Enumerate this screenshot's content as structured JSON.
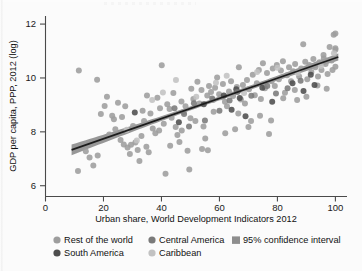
{
  "chart_data": {
    "type": "scatter",
    "title": "",
    "xlabel": "Urban share, World Development Indicators 2012",
    "ylabel": "GDP per capita, PPP, 2012 (log)",
    "xlim": [
      0,
      104
    ],
    "ylim": [
      5.6,
      12.3
    ],
    "xticks": [
      0,
      20,
      40,
      60,
      80,
      100
    ],
    "yticks": [
      6,
      8,
      10,
      12
    ],
    "xtick_labels": [
      "0",
      "20",
      "40",
      "60",
      "80",
      "100"
    ],
    "ytick_labels": [
      "6",
      "8",
      "10",
      "12"
    ],
    "grid": false,
    "legend_position": "below",
    "regression_line": {
      "label": "fit",
      "color": "#1c1c1c",
      "x_start": 9,
      "y_start": 7.33,
      "x_end": 101,
      "y_end": 10.78,
      "slope": 0.0375,
      "intercept": 6.993
    },
    "confidence_band": {
      "label": "95% confidence interval",
      "color": "#8e8e8e",
      "level": 0.95,
      "half_width_at_xmin": 0.2,
      "half_width_at_mid": 0.07,
      "half_width_at_xmax": 0.13
    },
    "series": [
      {
        "name": "Rest of the world",
        "color": "#9d9d9d",
        "points": [
          [
            11.5,
            10.28
          ],
          [
            17.8,
            9.93
          ],
          [
            19.1,
            8.66
          ],
          [
            20.4,
            8.96
          ],
          [
            21.2,
            9.3
          ],
          [
            23.6,
            8.47
          ],
          [
            24.1,
            8.1
          ],
          [
            25.9,
            7.7
          ],
          [
            26.4,
            8.55
          ],
          [
            27.0,
            7.53
          ],
          [
            28.3,
            7.42
          ],
          [
            29.1,
            7.18
          ],
          [
            30.2,
            8.22
          ],
          [
            31.0,
            7.6
          ],
          [
            31.8,
            7.33
          ],
          [
            32.4,
            6.92
          ],
          [
            33.1,
            7.85
          ],
          [
            34.0,
            8.4
          ],
          [
            34.8,
            7.45
          ],
          [
            35.6,
            7.24
          ],
          [
            36.2,
            8.68
          ],
          [
            37.0,
            8.12
          ],
          [
            37.9,
            7.95
          ],
          [
            38.6,
            9.27
          ],
          [
            39.2,
            8.05
          ],
          [
            40.1,
            10.47
          ],
          [
            40.8,
            8.3
          ],
          [
            41.4,
            6.44
          ],
          [
            42.0,
            9.02
          ],
          [
            42.8,
            8.85
          ],
          [
            43.5,
            8.52
          ],
          [
            44.1,
            9.44
          ],
          [
            44.9,
            8.18
          ],
          [
            45.5,
            7.88
          ],
          [
            46.2,
            7.62
          ],
          [
            46.9,
            9.13
          ],
          [
            47.6,
            8.74
          ],
          [
            48.3,
            8.95
          ],
          [
            49.0,
            7.3
          ],
          [
            49.6,
            6.6
          ],
          [
            50.3,
            9.6
          ],
          [
            51.0,
            9.22
          ],
          [
            51.7,
            8.4
          ],
          [
            52.4,
            9.86
          ],
          [
            53.1,
            9.05
          ],
          [
            53.8,
            9.55
          ],
          [
            54.5,
            8.2
          ],
          [
            55.1,
            7.75
          ],
          [
            55.8,
            9.35
          ],
          [
            56.4,
            9.7
          ],
          [
            57.1,
            9.48
          ],
          [
            57.8,
            9.18
          ],
          [
            58.5,
            9.64
          ],
          [
            59.2,
            10.02
          ],
          [
            59.9,
            9.4
          ],
          [
            60.5,
            9.28
          ],
          [
            61.2,
            9.78
          ],
          [
            61.9,
            9.12
          ],
          [
            62.6,
            8.95
          ],
          [
            63.3,
            9.5
          ],
          [
            64.0,
            9.88
          ],
          [
            64.7,
            9.33
          ],
          [
            65.4,
            8.1
          ],
          [
            66.0,
            9.66
          ],
          [
            66.7,
            10.4
          ],
          [
            67.4,
            9.2
          ],
          [
            68.1,
            9.74
          ],
          [
            68.8,
            9.05
          ],
          [
            69.5,
            9.92
          ],
          [
            70.2,
            9.58
          ],
          [
            70.9,
            8.4
          ],
          [
            71.5,
            10.12
          ],
          [
            72.2,
            9.36
          ],
          [
            72.9,
            9.8
          ],
          [
            73.6,
            10.3
          ],
          [
            74.3,
            9.22
          ],
          [
            75.0,
            10.55
          ],
          [
            75.7,
            9.62
          ],
          [
            76.4,
            10.18
          ],
          [
            77.1,
            7.92
          ],
          [
            77.8,
            8.42
          ],
          [
            78.4,
            10.35
          ],
          [
            79.1,
            9.7
          ],
          [
            79.8,
            10.48
          ],
          [
            80.5,
            9.95
          ],
          [
            81.2,
            10.28
          ],
          [
            81.9,
            10.62
          ],
          [
            82.6,
            9.45
          ],
          [
            83.3,
            10.1
          ],
          [
            84.0,
            10.4
          ],
          [
            84.7,
            9.88
          ],
          [
            85.4,
            10.25
          ],
          [
            86.1,
            10.52
          ],
          [
            86.8,
            9.18
          ],
          [
            87.5,
            10.05
          ],
          [
            88.2,
            10.35
          ],
          [
            88.9,
            11.25
          ],
          [
            89.6,
            10.6
          ],
          [
            90.3,
            9.95
          ],
          [
            91.0,
            10.48
          ],
          [
            91.7,
            10.22
          ],
          [
            92.4,
            10.7
          ],
          [
            93.1,
            10.4
          ],
          [
            93.8,
            9.72
          ],
          [
            94.5,
            10.58
          ],
          [
            95.2,
            10.3
          ],
          [
            95.9,
            10.85
          ],
          [
            96.6,
            10.52
          ],
          [
            97.3,
            10.15
          ],
          [
            98.0,
            11.15
          ],
          [
            98.7,
            10.65
          ],
          [
            99.4,
            11.6
          ],
          [
            100.0,
            11.65
          ],
          [
            100.0,
            11.05
          ],
          [
            100.0,
            11.1
          ],
          [
            100.0,
            10.42
          ],
          [
            99.0,
            10.3
          ],
          [
            97.0,
            9.6
          ],
          [
            13.9,
            7.28
          ],
          [
            15.2,
            7.05
          ],
          [
            16.5,
            6.75
          ],
          [
            18.0,
            7.12
          ],
          [
            11.2,
            6.55
          ],
          [
            22.0,
            7.9
          ],
          [
            23.0,
            8.6
          ],
          [
            25.0,
            9.08
          ],
          [
            27.5,
            8.95
          ],
          [
            29.5,
            7.52
          ],
          [
            33.5,
            8.78
          ],
          [
            35.0,
            9.35
          ],
          [
            39.5,
            8.88
          ],
          [
            43.0,
            7.48
          ],
          [
            47.0,
            8.05
          ],
          [
            50.0,
            8.5
          ],
          [
            54.0,
            7.36
          ],
          [
            56.0,
            7.32
          ],
          [
            58.0,
            8.75
          ],
          [
            62.0,
            7.95
          ],
          [
            66.5,
            8.68
          ],
          [
            70.0,
            8.18
          ],
          [
            74.0,
            8.6
          ],
          [
            78.0,
            9.88
          ],
          [
            82.0,
            9.25
          ],
          [
            86.0,
            9.55
          ],
          [
            90.0,
            9.3
          ],
          [
            94.0,
            10.05
          ],
          [
            96.0,
            10.72
          ]
        ]
      },
      {
        "name": "South America",
        "color": "#4d4d4d",
        "points": [
          [
            30.8,
            8.72
          ],
          [
            54.6,
            9.02
          ],
          [
            61.5,
            9.35
          ],
          [
            64.2,
            8.82
          ],
          [
            65.8,
            9.58
          ],
          [
            67.0,
            9.26
          ],
          [
            74.8,
            9.64
          ],
          [
            78.2,
            9.12
          ],
          [
            85.2,
            9.8
          ],
          [
            89.0,
            9.52
          ],
          [
            91.5,
            10.12
          ],
          [
            92.8,
            9.74
          ],
          [
            46.0,
            8.36
          ],
          [
            69.0,
            8.58
          ]
        ]
      },
      {
        "name": "Central America",
        "color": "#7a7a7a",
        "points": [
          [
            44.5,
            8.88
          ],
          [
            47.8,
            8.66
          ],
          [
            51.2,
            9.06
          ],
          [
            55.0,
            8.42
          ],
          [
            57.5,
            9.24
          ],
          [
            60.0,
            8.78
          ],
          [
            63.5,
            9.16
          ],
          [
            66.2,
            9.48
          ],
          [
            71.0,
            9.34
          ],
          [
            76.5,
            9.7
          ],
          [
            79.5,
            9.42
          ],
          [
            83.5,
            9.62
          ],
          [
            88.0,
            9.9
          ],
          [
            49.5,
            8.2
          ]
        ]
      },
      {
        "name": "Caribbean",
        "color": "#c2c2c2",
        "points": [
          [
            28.0,
            8.08
          ],
          [
            31.5,
            7.68
          ],
          [
            36.8,
            9.18
          ],
          [
            40.5,
            9.46
          ],
          [
            45.0,
            9.92
          ],
          [
            52.0,
            9.3
          ],
          [
            58.8,
            9.82
          ],
          [
            62.5,
            10.08
          ],
          [
            68.5,
            9.44
          ],
          [
            73.0,
            10.22
          ],
          [
            80.0,
            10.38
          ],
          [
            87.0,
            10.18
          ],
          [
            95.0,
            10.44
          ],
          [
            99.5,
            10.92
          ]
        ]
      }
    ]
  },
  "legend": {
    "items": [
      {
        "label": "Rest of the world",
        "marker": "circle",
        "color": "#9d9d9d"
      },
      {
        "label": "South America",
        "marker": "circle",
        "color": "#4d4d4d"
      },
      {
        "label": "Central America",
        "marker": "circle",
        "color": "#7a7a7a"
      },
      {
        "label": "Caribbean",
        "marker": "circle",
        "color": "#c2c2c2"
      },
      {
        "label": "95% confidence interval",
        "marker": "square",
        "color": "#8e8e8e"
      }
    ]
  }
}
